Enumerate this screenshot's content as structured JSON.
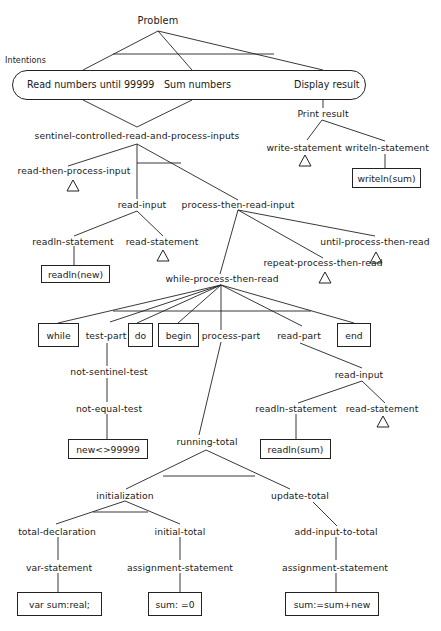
{
  "diagram": {
    "root": "Problem",
    "intentions_label": "Intentions",
    "intentions": [
      "Read numbers until 99999",
      "Sum numbers",
      "Display result"
    ],
    "nodes": {
      "print_result": "Print result",
      "write_statement": "write-statement",
      "writeln_statement": "writeln-statement",
      "writeln_code": "writeln(sum)",
      "sentinel": "sentinel-controlled-read-and-process-inputs",
      "read_then_process": "read-then-process-input",
      "read_input_1": "read-input",
      "process_then_read": "process-then-read-input",
      "readln_statement_1": "readln-statement",
      "read_statement_1": "read-statement",
      "readln_new_code": "readln(new)",
      "until_ptr": "until-process-then-read",
      "repeat_ptr": "repeat-process-then-read",
      "while_ptr": "while-process-then-read",
      "kw_while": "while",
      "test_part": "test-part",
      "kw_do": "do",
      "kw_begin": "begin",
      "process_part": "process-part",
      "read_part": "read-part",
      "kw_end": "end",
      "not_sentinel_test": "not-sentinel-test",
      "not_equal_test": "not-equal-test",
      "test_code": "new<>99999",
      "read_input_2": "read-input",
      "readln_statement_2": "readln-statement",
      "read_statement_2": "read-statement",
      "readln_sum_code": "readln(sum)",
      "running_total": "running-total",
      "initialization": "initialization",
      "update_total": "update-total",
      "total_declaration": "total-declaration",
      "initial_total": "initial-total",
      "add_input_to_total": "add-input-to-total",
      "var_statement": "var-statement",
      "assignment_statement_1": "assignment-statement",
      "assignment_statement_2": "assignment-statement",
      "var_code": "var sum:real;",
      "init_code": "sum: =0",
      "update_code": "sum:=sum+new"
    }
  }
}
